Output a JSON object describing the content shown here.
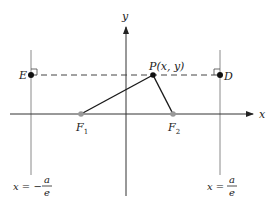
{
  "diagram": {
    "colors": {
      "axis": "#333333",
      "directrix": "#8a8a8a",
      "dashed": "#444444",
      "segment": "#1a1a1a",
      "point": "#111111",
      "focus": "#999999",
      "text": "#222222"
    },
    "axes": {
      "x_label": "x",
      "y_label": "y"
    },
    "points": {
      "P": {
        "label": "P(x, y)"
      },
      "E": {
        "label": "E"
      },
      "D": {
        "label": "D"
      },
      "F1": {
        "label": "F",
        "sub": "1"
      },
      "F2": {
        "label": "F",
        "sub": "2"
      }
    },
    "directrices": {
      "left": {
        "lhs": "x = −",
        "num": "a",
        "den": "e"
      },
      "right": {
        "lhs": "x =",
        "num": "a",
        "den": "e"
      }
    }
  }
}
